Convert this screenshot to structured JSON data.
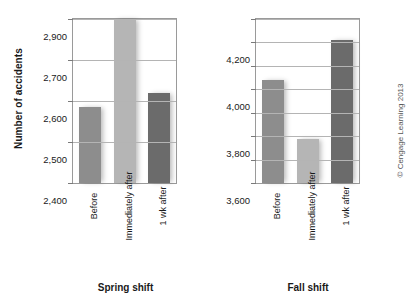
{
  "figure": {
    "ylabel": "Number of accidents",
    "credit": "© Cengage Learning 2013"
  },
  "chart_data": [
    {
      "type": "bar",
      "title": "Spring shift",
      "xlabel": "",
      "ylabel": "Number of accidents",
      "categories": [
        "Before",
        "Immediately after",
        "1 wk after"
      ],
      "values": [
        2585,
        2900,
        2620
      ],
      "ylim": [
        2400,
        2900
      ],
      "yticks": [
        2400,
        2500,
        2600,
        2700,
        2900
      ],
      "yticklabels": [
        "2,400",
        "2,500",
        "2,600",
        "2,700",
        "2,900"
      ],
      "grid": true,
      "legend": "none",
      "bar_colors": [
        "#8d8d8d",
        "#b5b5b5",
        "#6b6b6b"
      ],
      "note": "Axis segment between 2,700 and 2,900 is compressed; no 2,800 tick label is shown."
    },
    {
      "type": "bar",
      "title": "Fall shift",
      "xlabel": "",
      "ylabel": "Number of accidents",
      "categories": [
        "Before",
        "Immediately after",
        "1 wk after"
      ],
      "values": [
        4040,
        3790,
        4210
      ],
      "ylim": [
        3600,
        4300
      ],
      "yticks": [
        3600,
        3700,
        3800,
        3900,
        4000,
        4100,
        4200,
        4300
      ],
      "yticklabels": [
        "3,600",
        "",
        "3,800",
        "",
        "4,000",
        "",
        "4,200",
        ""
      ],
      "grid": true,
      "legend": "none",
      "bar_colors": [
        "#8d8d8d",
        "#b5b5b5",
        "#6b6b6b"
      ]
    }
  ]
}
